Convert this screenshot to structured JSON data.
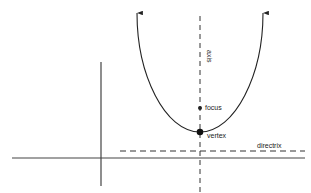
{
  "diagram": {
    "labels": {
      "axis": "axis",
      "focus": "focus",
      "vertex": "vertex",
      "directrix": "directrix"
    },
    "colors": {
      "stroke": "#222222",
      "background": "#ffffff"
    }
  }
}
